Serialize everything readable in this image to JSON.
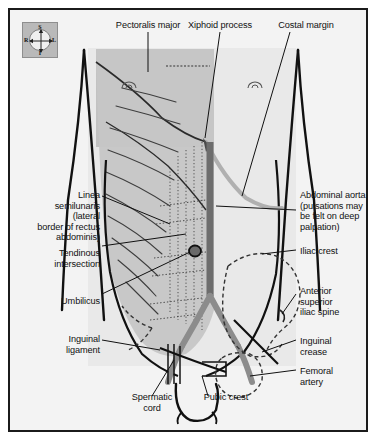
{
  "figure": {
    "background_color": "#f3f3f3",
    "frame_color": "#1b1b1b",
    "muscle_shade_color": "#c9c9c9",
    "pectoral_shade_color": "#bdbdbd",
    "aorta_color": "#6f6f6f",
    "artery_color": "#8a8a8a",
    "outline_color": "#111111",
    "bone_dash_color": "#3a3a3a"
  },
  "compass": {
    "name": "orientation-compass",
    "superior": "S",
    "inferior": "I",
    "right": "R",
    "left": "L"
  },
  "labels": {
    "pectoralis_major": "Pectoralis major",
    "xiphoid_process": "Xiphoid process",
    "costal_margin": "Costal margin",
    "linea_semilunaris": "Linea\nsemilunaris\n(lateral\nborder of rectus\nabdominis)",
    "tendinous_intersection": "Tendinous\nintersection",
    "umbilicus": "Umbilicus",
    "inguinal_ligament": "Inguinal\nligament",
    "abdominal_aorta": "Abdominal aorta\n(pulsations may\nbe felt on deep\npalpation)",
    "iliac_crest": "Iliac crest",
    "anterior_superior_iliac_spine": "Anterior\nsuperior\niliac spine",
    "inguinal_crease": "Inguinal\ncrease",
    "femoral_artery": "Femoral\nartery",
    "spermatic_cord": "Spermatic\ncord",
    "pubic_crest": "Pubic crest"
  }
}
